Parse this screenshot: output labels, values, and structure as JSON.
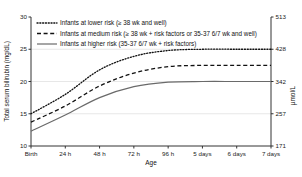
{
  "chart_data": {
    "type": "line",
    "title": "",
    "xlabel": "Age",
    "ylabel": "Total serum bilirubin (mg/dL)",
    "y2label": "µmol/L",
    "grid": true,
    "legend_position": "top-left",
    "x_categories": [
      "Birth",
      "24 h",
      "48 h",
      "72 h",
      "96 h",
      "5 days",
      "6 days",
      "7 days"
    ],
    "x_hours": [
      0,
      24,
      48,
      72,
      96,
      120,
      144,
      168
    ],
    "ylim": [
      10,
      30
    ],
    "y_ticks": [
      10,
      15,
      20,
      25,
      30
    ],
    "y2_ticks": [
      171,
      257,
      342,
      428,
      513
    ],
    "y2_ticklabels": [
      "171",
      "257",
      "342",
      "428",
      "513"
    ],
    "series": [
      {
        "name": "Infants at lower risk (≥ 38 wk and well)",
        "style": "dotted",
        "color": "#111111",
        "values": [
          15.0,
          18.0,
          21.8,
          23.9,
          24.8,
          25.0,
          25.0,
          25.0
        ]
      },
      {
        "name": "Infants at medium risk (≥ 38 wk + risk factors or 35-37 6/7 wk and well)",
        "style": "dashed",
        "color": "#111111",
        "values": [
          13.7,
          16.2,
          19.3,
          21.3,
          22.3,
          22.5,
          22.5,
          22.5
        ]
      },
      {
        "name": "Infants at higher risk (35-37 6/7 wk + risk factors)",
        "style": "solid",
        "color": "#6a6a6a",
        "values": [
          12.3,
          14.8,
          17.5,
          19.2,
          19.9,
          20.0,
          20.0,
          20.0
        ]
      }
    ]
  },
  "legend": {
    "items": [
      {
        "label": "Infants at lower risk (≥ 38 wk and well)",
        "style": "dotted"
      },
      {
        "label": "Infants at medium risk (≥ 38 wk + risk factors or 35-37 6/7 wk and well)",
        "style": "dashed"
      },
      {
        "label": "Infants at higher risk (35-37 6/7 wk + risk factors)",
        "style": "solid"
      }
    ]
  }
}
